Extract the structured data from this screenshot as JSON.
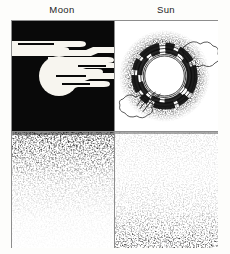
{
  "figure": {
    "title_left": "Moon",
    "title_right": "Sun",
    "panel_count": 4,
    "colors": {
      "ink": "#0a0a0a",
      "paper": "#ffffff",
      "frame": "#8d8d8d",
      "night_sky": "#090909",
      "caption_text": "#242424"
    },
    "panels": [
      {
        "id": "moon-sky",
        "label": "Moon",
        "rendering": "negative",
        "background": "#090909",
        "body": "white lunar disc",
        "body_center": [
          47,
          55
        ],
        "body_radius": 20,
        "features": "horizontal white cloud bands with forked tails crossing the disc",
        "cloud_band_count": 4
      },
      {
        "id": "sun-sky",
        "label": "Sun",
        "rendering": "positive",
        "background": "#ffffff",
        "body": "white solar disc ringed by dark stippled annuli",
        "body_center": [
          50,
          55
        ],
        "body_radius": 27,
        "features": "concentric rings, heavy stipple corona, scalloped cloud outlines at right and lower-left",
        "ring_count": 5
      },
      {
        "id": "moon-ground",
        "label": "Moon",
        "stipple": "dense at top, fading downward",
        "density_top": 1.0,
        "density_bottom": 0.06
      },
      {
        "id": "sun-ground",
        "label": "Sun",
        "stipple": "sparse at top, densest along the bottom edge",
        "density_top": 0.08,
        "density_bottom": 0.85
      }
    ]
  }
}
